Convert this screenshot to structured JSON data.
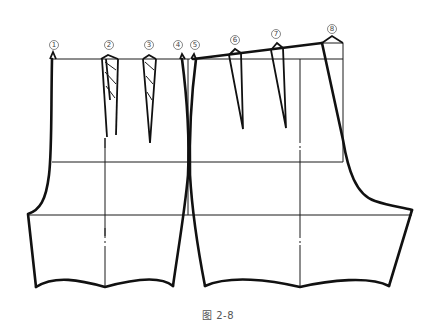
{
  "figure": {
    "caption": "图 2-8"
  },
  "markers": [
    {
      "id": 1,
      "label": "①",
      "x": 52,
      "y": 45
    },
    {
      "id": 2,
      "label": "②",
      "x": 108,
      "y": 45
    },
    {
      "id": 3,
      "label": "③",
      "x": 149,
      "y": 45
    },
    {
      "id": 4,
      "label": "④",
      "x": 178,
      "y": 45
    },
    {
      "id": 5,
      "label": "⑤",
      "x": 195,
      "y": 45
    },
    {
      "id": 6,
      "label": "⑥",
      "x": 235,
      "y": 40
    },
    {
      "id": 7,
      "label": "⑦",
      "x": 276,
      "y": 34
    },
    {
      "id": 8,
      "label": "⑧",
      "x": 332,
      "y": 29
    }
  ],
  "colors": {
    "line": "#111111",
    "background": "#ffffff",
    "label": "#444444"
  }
}
